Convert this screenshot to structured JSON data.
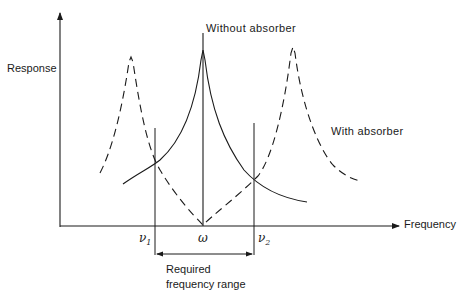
{
  "diagram": {
    "y_axis_label": "Response",
    "x_axis_label": "Frequency",
    "curve_labels": {
      "without_absorber": "Without absorber",
      "with_absorber": "With absorber"
    },
    "markers": {
      "nu1": {
        "symbol": "ν",
        "sub": "1"
      },
      "omega": {
        "symbol": "ω"
      },
      "nu2": {
        "symbol": "ν",
        "sub": "2"
      }
    },
    "range_label": {
      "line1": "Required",
      "line2": "frequency range"
    },
    "colors": {
      "ink": "#1a1a1a",
      "background": "#ffffff"
    }
  }
}
